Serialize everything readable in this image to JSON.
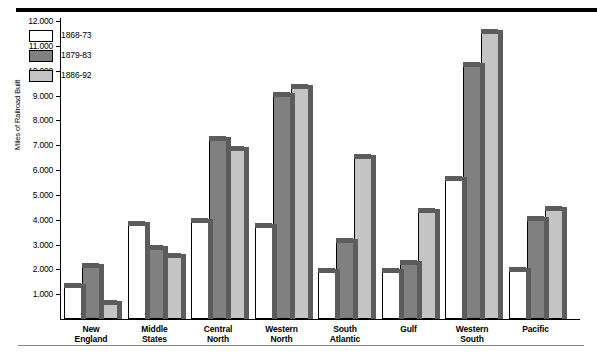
{
  "chart_data": {
    "type": "bar",
    "title": "",
    "xlabel": "",
    "ylabel": "Miles of Railroad Built",
    "ylim": [
      0,
      12000
    ],
    "ytick_labels": [
      "12.000",
      "11.000",
      "10.000",
      "9.000",
      "8.000",
      "7.000",
      "6.000",
      "5.000",
      "4.000",
      "3.000",
      "2.000",
      "1.000"
    ],
    "ytick_values": [
      12000,
      11000,
      10000,
      9000,
      8000,
      7000,
      6000,
      5000,
      4000,
      3000,
      2000,
      1000
    ],
    "grid": false,
    "legend_position": "upper-left-inside",
    "categories": [
      "New\nEngland",
      "Middle\nStates",
      "Central\nNorth",
      "Western\nNorth",
      "South\nAtlantic",
      "Gulf",
      "Western\nSouth",
      "Pacific"
    ],
    "category_lines": [
      [
        "New",
        "England"
      ],
      [
        "Middle",
        "States"
      ],
      [
        "Central",
        "North"
      ],
      [
        "Western",
        "North"
      ],
      [
        "South",
        "Atlantic"
      ],
      [
        "Gulf",
        ""
      ],
      [
        "Western",
        "South"
      ],
      [
        "Pacific",
        ""
      ]
    ],
    "series": [
      {
        "name": "1868-73",
        "color": "#ffffff",
        "values": [
          1300,
          3800,
          3900,
          3700,
          1900,
          1900,
          5600,
          1950
        ]
      },
      {
        "name": "1879-83",
        "color": "#808080",
        "values": [
          2100,
          2800,
          7200,
          9000,
          3100,
          2200,
          10200,
          4000
        ]
      },
      {
        "name": "1886-92",
        "color": "#c4c4c4",
        "values": [
          600,
          2500,
          6800,
          9300,
          6500,
          4300,
          11500,
          4400
        ]
      }
    ]
  },
  "legend": {
    "items": [
      {
        "label": "1868-73"
      },
      {
        "label": "1879-83"
      },
      {
        "label": "1886-92"
      }
    ]
  },
  "axis": {
    "y_title": "Miles of Railroad Built"
  }
}
